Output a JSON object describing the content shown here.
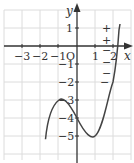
{
  "graph": {
    "function": "y = x^3 - 3x - 4",
    "x_axis_label": "x",
    "y_axis_label": "y",
    "origin_label": "O",
    "x_ticks": [
      {
        "value": -3,
        "label": "−3"
      },
      {
        "value": -2,
        "label": "−2"
      },
      {
        "value": -1,
        "label": "−1"
      },
      {
        "value": 1,
        "label": "1"
      },
      {
        "value": 2,
        "label": "2"
      }
    ],
    "y_ticks": [
      {
        "value": 1,
        "label": "1"
      },
      {
        "value": -1,
        "label": "−1"
      },
      {
        "value": -2,
        "label": "−2"
      },
      {
        "value": -3,
        "label": "−3"
      },
      {
        "value": -4,
        "label": "−4"
      },
      {
        "value": -5,
        "label": "−5"
      }
    ],
    "sign_marks": [
      "+",
      "+",
      "−",
      "−",
      "−",
      "−"
    ],
    "colors": {
      "grid": "#d9d9d9",
      "axis": "#333333",
      "curve": "#444444"
    }
  }
}
